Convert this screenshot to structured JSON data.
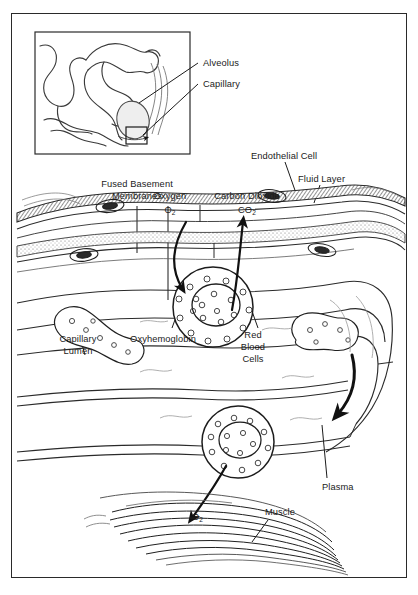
{
  "figure": {
    "frame_color": "#2a2a2a",
    "ink_color": "#1b1b1b",
    "background": "#ffffff"
  },
  "inset": {
    "name": "alveolar-sac-inset",
    "detail_box_label": ""
  },
  "labels": {
    "alveolus": "Alveolus",
    "capillary": "Capillary",
    "endothelial_cell": "Endothelial Cell",
    "fluid_layer": "Fluid Layer",
    "fused_basement_membranes_l1": "Fused Basement",
    "fused_basement_membranes_l2": "Membranes",
    "oxygen_name": "Oxygen",
    "oxygen_formula": "O",
    "oxygen_sub": "2",
    "carbon_dioxide_name": "Carbon Dioxide",
    "carbon_dioxide_formula": "CO",
    "carbon_dioxide_sub": "2",
    "capillary_lumen_l1": "Capillary",
    "capillary_lumen_l2": "Lumen",
    "oxyhemoglobin": "Oxyhemoglobin",
    "red_blood_cells_l1": "Red",
    "red_blood_cells_l2": "Blood",
    "red_blood_cells_l3": "Cells",
    "plasma": "Plasma",
    "muscle": "Muscle",
    "o2_muscle_formula": "O",
    "o2_muscle_sub": "2"
  }
}
